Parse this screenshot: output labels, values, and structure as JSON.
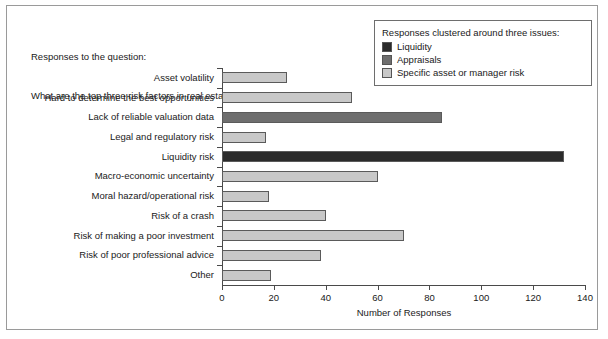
{
  "question": {
    "line1": "Responses to the question:",
    "line2": "What are the top three risk factors in real estate investment?"
  },
  "legend": {
    "title": "Responses clustered around three issues:",
    "items": [
      {
        "label": "Liquidity",
        "color": "#2b2b2b"
      },
      {
        "label": "Appraisals",
        "color": "#6e6e6e"
      },
      {
        "label": "Specific asset or manager risk",
        "color": "#c8c8c8"
      }
    ]
  },
  "chart_data": {
    "type": "bar",
    "orientation": "horizontal",
    "title": "",
    "xlabel": "Number of Responses",
    "ylabel": "",
    "xlim": [
      0,
      140
    ],
    "xticks": [
      0,
      20,
      40,
      60,
      80,
      100,
      120,
      140
    ],
    "grid": false,
    "legend_position": "top-right",
    "categories": [
      "Asset volatility",
      "Hard to determine the best opportunities",
      "Lack of reliable valuation data",
      "Legal and regulatory risk",
      "Liquidity risk",
      "Macro-economic uncertainty",
      "Moral hazard/operational risk",
      "Risk of a crash",
      "Risk of making a poor investment",
      "Risk of poor professional advice",
      "Other"
    ],
    "values": [
      25,
      50,
      85,
      17,
      132,
      60,
      18,
      40,
      70,
      38,
      19
    ],
    "groups": [
      "Specific asset or manager risk",
      "Specific asset or manager risk",
      "Appraisals",
      "Specific asset or manager risk",
      "Liquidity",
      "Specific asset or manager risk",
      "Specific asset or manager risk",
      "Specific asset or manager risk",
      "Specific asset or manager risk",
      "Specific asset or manager risk",
      "Specific asset or manager risk"
    ],
    "colors": {
      "Liquidity": "#2b2b2b",
      "Appraisals": "#6e6e6e",
      "Specific asset or manager risk": "#c8c8c8"
    }
  }
}
